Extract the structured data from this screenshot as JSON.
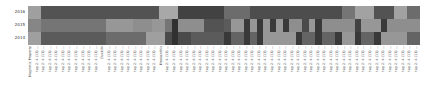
{
  "chart_data": {
    "type": "heatmap",
    "title": "",
    "xlabel": "",
    "ylabel": "",
    "y_categories": [
      "2016",
      "2015",
      "2014"
    ],
    "colormap": "grayscale (light = high, dark = low)",
    "x_categories": [
      "Magnetic Property",
      "tag 2: 4-(13) ...",
      "tag 2: 4-(13) ...",
      "tag 2: 4-(13) ...",
      "tag 2: 4-(13) ...",
      "tag 2: 4-(13) ...",
      "tag 2: 4-(13) ...",
      "tag 2: 4-(13) ...",
      "tag 2: 4-(13) ...",
      "tag 2: 4-(13) ...",
      "tag 2: 4-(13) ...",
      "Ouckim",
      "tag 2: 4-(13) ...",
      "tag 2: 4-(13) ...",
      "tag 2: 4-(13) ...",
      "tag 2: 4-(13) ...",
      "tag 2: 4-(13) ...",
      "tag 2: 4-(13) ...",
      "tag 2: 4-(13) ...",
      "tag 2: 4-(13) ...",
      "Mezoanthis",
      "tag 2: 4-(13) ...",
      "tag 2: 4-(13) ...",
      "tag 2: 4-(13) ...",
      "tag 2: 4-(13) ...",
      "tag 2: 4-(13) ...",
      "tag 2: 4-(13) ...",
      "tag 2: 4-(13) ...",
      "tag 2: 4-(13) ...",
      "tag 2: 4-(13) ...",
      "tag 2: 4-(13) ...",
      "tag 2: 4-(13) ...",
      "tag 2: 4-(13) ...",
      "tag 2: 4-(13) ...",
      "tag 2: 4-(13) ...",
      "tag 2: 4-(13) ...",
      "tag 2: 4-(13) ...",
      "tag 2: 4-(13) ...",
      "tag 2: 4-(13) ...",
      "tag 2: 4-(13) ...",
      "tag 2: 4-(13) ...",
      "tag 2: 4-(13) ...",
      "tag 2: 4-(13) ...",
      "tag 2: 4-(13) ...",
      "tag 2: 4-(13) ...",
      "tag 2: 4-(13) ...",
      "tag 2: 4-(13) ...",
      "tag 2: 4-(13) ...",
      "tag 2: 4-(13) ...",
      "tag 2: 4-(13) ...",
      "tag 2: 4-(13) ...",
      "tag 2: 4-(13) ...",
      "tag 2: 4-(13) ...",
      "tag 2: 4-(13) ...",
      "tag 2: 4-(13) ...",
      "tag 2: 4-(13) ...",
      "tag 2: 4-(13) ...",
      "tag 2: 4-(13) ...",
      "tag 2: 4-(13) ...",
      "tag 2: 4-(13) ..."
    ],
    "values": [
      [
        0.7,
        0.7,
        0.25,
        0.25,
        0.25,
        0.25,
        0.25,
        0.25,
        0.25,
        0.25,
        0.25,
        0.25,
        0.25,
        0.25,
        0.25,
        0.25,
        0.25,
        0.25,
        0.25,
        0.25,
        0.75,
        0.75,
        0.75,
        0.15,
        0.15,
        0.15,
        0.15,
        0.15,
        0.15,
        0.15,
        0.4,
        0.4,
        0.4,
        0.4,
        0.22,
        0.22,
        0.22,
        0.22,
        0.22,
        0.22,
        0.22,
        0.22,
        0.22,
        0.22,
        0.22,
        0.22,
        0.22,
        0.22,
        0.45,
        0.45,
        0.72,
        0.72,
        0.72,
        0.25,
        0.25,
        0.25,
        0.72,
        0.72,
        0.4,
        0.4
      ],
      [
        0.55,
        0.55,
        0.45,
        0.45,
        0.45,
        0.45,
        0.45,
        0.45,
        0.45,
        0.45,
        0.45,
        0.45,
        0.65,
        0.65,
        0.65,
        0.65,
        0.6,
        0.6,
        0.6,
        0.65,
        0.65,
        0.45,
        0.05,
        0.6,
        0.6,
        0.6,
        0.6,
        0.25,
        0.25,
        0.25,
        0.3,
        0.65,
        0.65,
        0.1,
        0.65,
        0.1,
        0.65,
        0.1,
        0.65,
        0.1,
        0.6,
        0.6,
        0.2,
        0.65,
        0.1,
        0.6,
        0.6,
        0.6,
        0.6,
        0.6,
        0.15,
        0.65,
        0.65,
        0.65,
        0.1,
        0.6,
        0.6,
        0.6,
        0.6,
        0.6
      ],
      [
        0.7,
        0.7,
        0.3,
        0.3,
        0.3,
        0.3,
        0.3,
        0.3,
        0.3,
        0.3,
        0.3,
        0.3,
        0.4,
        0.4,
        0.4,
        0.4,
        0.4,
        0.4,
        0.7,
        0.7,
        0.7,
        0.2,
        0.05,
        0.2,
        0.2,
        0.3,
        0.3,
        0.3,
        0.3,
        0.3,
        0.1,
        0.35,
        0.35,
        0.1,
        0.35,
        0.1,
        0.65,
        0.65,
        0.65,
        0.65,
        0.65,
        0.1,
        0.35,
        0.35,
        0.1,
        0.35,
        0.35,
        0.1,
        0.65,
        0.65,
        0.1,
        0.35,
        0.35,
        0.1,
        0.65,
        0.65,
        0.65,
        0.65,
        0.35,
        0.35
      ]
    ]
  }
}
